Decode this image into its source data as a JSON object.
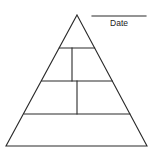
{
  "diagram": {
    "type": "pyramid-worksheet",
    "date_field": {
      "label": "Date",
      "value": ""
    },
    "tiers": [
      {
        "level": 1,
        "position": "top",
        "sections": 1,
        "text": ""
      },
      {
        "level": 2,
        "position": "upper-middle",
        "sections": 2,
        "text": [
          "",
          ""
        ]
      },
      {
        "level": 3,
        "position": "lower-middle",
        "sections": 2,
        "text": [
          "",
          ""
        ]
      },
      {
        "level": 4,
        "position": "bottom",
        "sections": 1,
        "text": ""
      }
    ],
    "colors": {
      "line": "#2a2a2a",
      "background": "#ffffff"
    }
  }
}
